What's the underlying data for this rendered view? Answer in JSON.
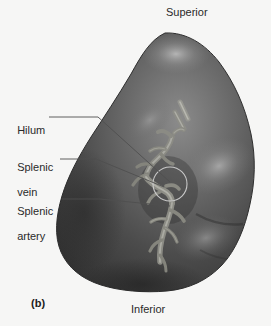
{
  "figure": {
    "panel_letter": "(b)",
    "orientation_labels": {
      "superior": "Superior",
      "inferior": "Inferior"
    },
    "callouts": [
      {
        "id": "hilum",
        "text": "Hilum",
        "lines": [
          "Hilum"
        ]
      },
      {
        "id": "splenic-vein",
        "text": "Splenic vein",
        "lines": [
          "Splenic",
          "vein"
        ]
      },
      {
        "id": "splenic-artery",
        "text": "Splenic artery",
        "lines": [
          "Splenic",
          "artery"
        ]
      }
    ],
    "colors": {
      "background": "#f6f6f5",
      "organ_dark": "#3a3a3a",
      "organ_mid": "#5d5d5d",
      "organ_highlight": "#a8a8a8",
      "vessel": "#8f8f8a",
      "leader_line": "#555555",
      "label_text": "#2a2a2a"
    },
    "marker": {
      "hilum_circle": {
        "cx": 170,
        "cy": 184,
        "r": 17
      }
    }
  }
}
